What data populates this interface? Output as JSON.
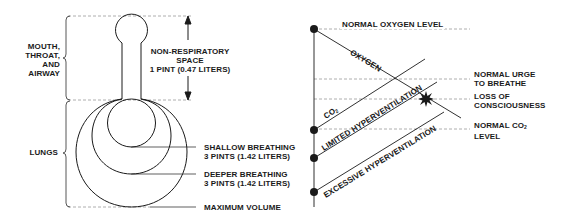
{
  "left_diagram": {
    "regions": {
      "upper": [
        "MOUTH,",
        "THROAT,",
        "AND",
        "AIRWAY"
      ],
      "lower": "LUNGS"
    },
    "non_respiratory": {
      "line1": "NON-RESPIRATORY",
      "line2": "SPACE",
      "line3": "1 PINT (0.47 LITERS)"
    },
    "volumes": [
      {
        "line1": "SHALLOW BREATHING",
        "line2": "3 PINTS (1.42 LITERS)"
      },
      {
        "line1": "DEEPER BREATHING",
        "line2": "3 PINTS (1.42 LITERS)"
      },
      {
        "line1": "MAXIMUM VOLUME"
      }
    ]
  },
  "right_diagram": {
    "levels": {
      "normal_oxygen": "NORMAL OXYGEN LEVEL",
      "normal_urge_1": "NORMAL URGE",
      "normal_urge_2": "TO BREATHE",
      "loss_1": "LOSS OF",
      "loss_2": "CONSCIOUSNESS",
      "normal_co2_1": "NORMAL CO",
      "normal_co2_sub": "2",
      "normal_co2_2": "LEVEL"
    },
    "lines": {
      "oxygen": "OXYGEN",
      "co2": "CO",
      "co2_sub": "2",
      "limited": "LIMITED HYPERVENTILATION",
      "excessive": "EXCESSIVE HYPERVENTILATION"
    }
  },
  "colors": {
    "ink": "#1a1a1a",
    "dash": "#9a9a9a"
  }
}
